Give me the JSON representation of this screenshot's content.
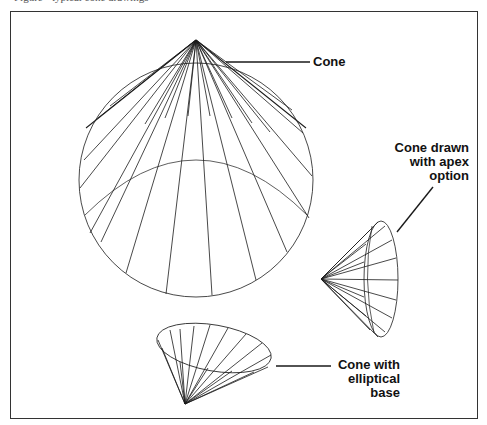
{
  "figure": {
    "caption": "Figure · typical cone drawings"
  },
  "labels": {
    "cone": "Cone",
    "apex_line1": "Cone drawn",
    "apex_line2": "with apex",
    "apex_line3": "option",
    "elliptical_line1": "Cone with",
    "elliptical_line2": "elliptical base"
  },
  "colors": {
    "line": "#1a1a1a",
    "frame": "#333333",
    "background": "#ffffff"
  }
}
